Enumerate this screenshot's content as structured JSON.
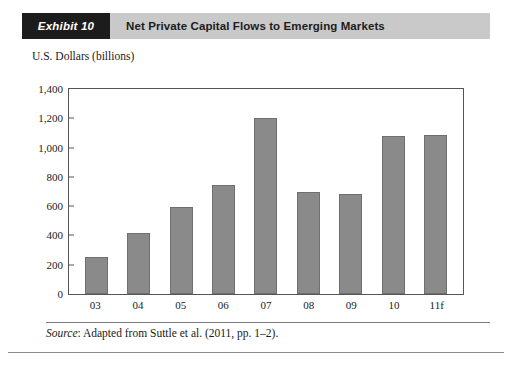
{
  "header": {
    "exhibit_tag": "Exhibit 10",
    "title": "Net Private Capital Flows to Emerging Markets",
    "tag_bg": "#1c1c1c",
    "bar_bg": "#c9c9c9"
  },
  "source": {
    "lead": "Source",
    "text": ": Adapted from Suttle et al. (2011, pp. 1–2)."
  },
  "chart_data": {
    "type": "bar",
    "title": "Net Private Capital Flows to Emerging Markets",
    "xlabel": "",
    "ylabel": "U.S. Dollars (billions)",
    "categories": [
      "03",
      "04",
      "05",
      "06",
      "07",
      "08",
      "09",
      "10",
      "11f"
    ],
    "values": [
      250,
      415,
      595,
      745,
      1200,
      700,
      685,
      1080,
      1085
    ],
    "ylim": [
      0,
      1400
    ],
    "ytick_values": [
      0,
      200,
      400,
      600,
      800,
      1000,
      1200,
      1400
    ],
    "ytick_labels": [
      "0",
      "200",
      "400",
      "600",
      "800",
      "1,000",
      "1,200",
      "1,400"
    ],
    "grid": false,
    "legend": false,
    "bar_color": "#8a8a8a",
    "bar_border_color": "#6f6f6f",
    "axis_color": "#555555"
  }
}
